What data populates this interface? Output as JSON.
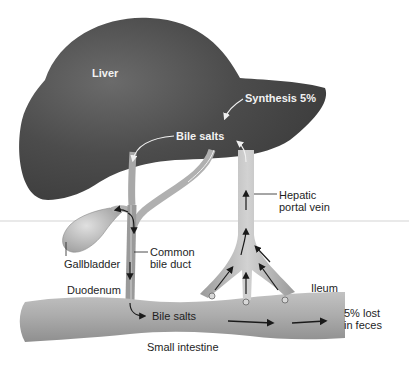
{
  "figure": {
    "colors": {
      "liver": "#4a4a4a",
      "liver_highlight": "#6a6a6a",
      "vessel": "#bdbdbd",
      "intestine": "#a9a9a9",
      "arrow": "#1a1a1a",
      "label_dark": "#1e1e1e",
      "label_light": "#f2f2f2"
    }
  },
  "labels": {
    "liver": "Liver",
    "synthesis": "Synthesis 5%",
    "bile_salts_liver": "Bile salts",
    "hepatic_portal_vein_line1": "Hepatic",
    "hepatic_portal_vein_line2": "portal vein",
    "gallbladder": "Gallbladder",
    "common_bile_duct_line1": "Common",
    "common_bile_duct_line2": "bile duct",
    "duodenum": "Duodenum",
    "bile_salts_intestine": "Bile salts",
    "ileum": "Ileum",
    "lost_line1": "5% lost",
    "lost_line2": "in feces",
    "small_intestine": "Small intestine"
  }
}
